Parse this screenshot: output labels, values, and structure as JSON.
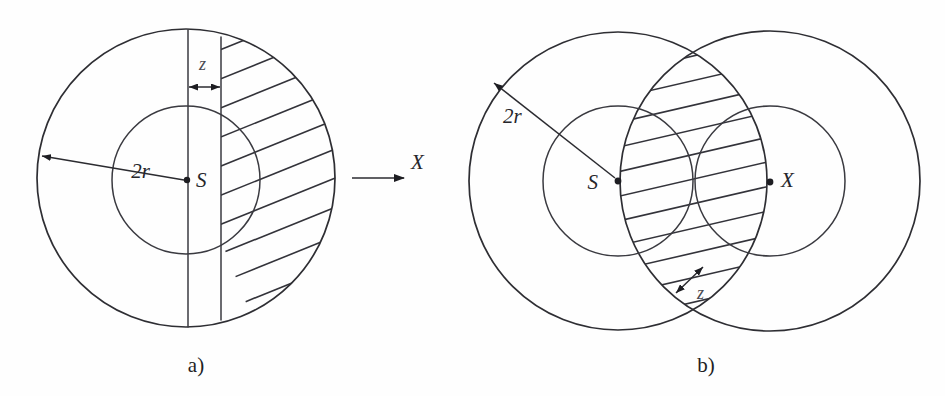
{
  "figure": {
    "background_color": "#fefefe",
    "ink_color": "#2e2e33",
    "panels": [
      {
        "id": "a",
        "caption": "a)",
        "caption_x": 196,
        "caption_y": 371,
        "description": "Single large circle with concentric inner circle, vertical strip of width z, hatched right portion, and axis arrow X",
        "outer_circle": {
          "cx": 186,
          "cy": 178,
          "r": 149
        },
        "inner_circle": {
          "cx": 186,
          "cy": 180,
          "r": 74
        },
        "strip": {
          "x_left": 188,
          "x_right": 221,
          "label": "z"
        },
        "labels": {
          "radius": "2r",
          "radius_x": 150,
          "radius_y": 178,
          "center_point": "S",
          "center_point_x": 196,
          "center_point_y": 186,
          "strip_width": "z",
          "strip_width_x": 199,
          "strip_width_y": 68,
          "axis": "X",
          "axis_x": 419,
          "axis_y": 168
        },
        "axis_arrow": {
          "x1": 352,
          "y1": 178,
          "x2": 404,
          "y2": 178,
          "label": "X"
        },
        "hatch": {
          "angle_deg": -22,
          "spacing": 27,
          "count": 11
        }
      },
      {
        "id": "b",
        "caption": "b)",
        "caption_x": 706,
        "caption_y": 371,
        "description": "Two overlapping large circles centered at S and X with concentric inner circles, hatched lens-shaped overlap region and z annotation",
        "left_outer_circle": {
          "cx": 618,
          "cy": 181,
          "r": 149
        },
        "right_outer_circle": {
          "cx": 770,
          "cy": 181,
          "r": 150
        },
        "left_inner_circle": {
          "cx": 618,
          "cy": 181,
          "r": 75
        },
        "right_inner_circle": {
          "cx": 770,
          "cy": 181,
          "r": 75
        },
        "labels": {
          "radius": "2r",
          "radius_x": 503,
          "radius_y": 122,
          "left_center_point": "S",
          "left_center_point_x": 598,
          "left_center_point_y": 188,
          "right_center_point": "X",
          "right_center_point_x": 779,
          "right_center_point_y": 186,
          "gap_width": "z",
          "gap_width_x": 697,
          "gap_width_y": 296
        },
        "hatch": {
          "angle_deg": -13,
          "spacing": 24,
          "count": 11
        }
      }
    ]
  }
}
